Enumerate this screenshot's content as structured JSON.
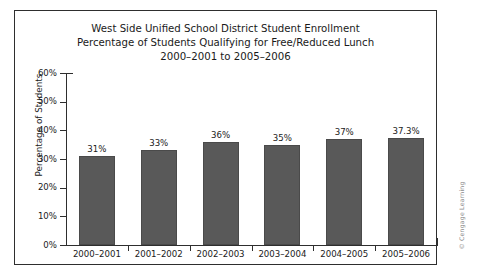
{
  "chart_data": {
    "type": "bar",
    "title": "West Side Unified School District Student Enrollment Percentage of Students Qualifying for Free/Reduced Lunch 2000–2001 to 2005–2006",
    "title_lines": [
      "West Side Unified School District Student Enrollment",
      "Percentage of Students Qualifying for Free/Reduced Lunch",
      "2000–2001 to 2005–2006"
    ],
    "xlabel": "",
    "ylabel": "Percentage of Students",
    "categories": [
      "2000–2001",
      "2001–2002",
      "2002–2003",
      "2003–2004",
      "2004–2005",
      "2005–2006"
    ],
    "values": [
      31,
      33,
      36,
      35,
      37,
      37.3
    ],
    "data_labels": [
      "31%",
      "33%",
      "36%",
      "35%",
      "37%",
      "37.3%"
    ],
    "ylim": [
      0,
      60
    ],
    "ytick_values": [
      0,
      10,
      20,
      30,
      40,
      50,
      60
    ],
    "ytick_labels": [
      "0%",
      "10%",
      "20%",
      "30%",
      "40%",
      "50%",
      "60%"
    ],
    "grid": false,
    "legend": null,
    "legend_position": "none",
    "bar_color": "#595959",
    "bar_edge_color": "#4a4a4a",
    "axis_color": "#2e2e2e",
    "background_color": "#ffffff"
  },
  "credit": {
    "text": "© Cengage Learning"
  }
}
